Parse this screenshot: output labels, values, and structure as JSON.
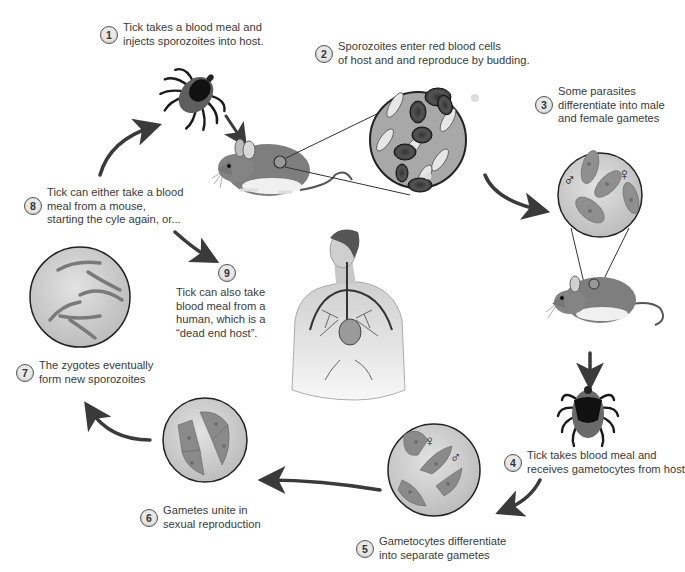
{
  "diagram": {
    "colors": {
      "line": "#3a3a3a",
      "circle_fill": "#cfcfcf",
      "cell_fill": "#8d8d8d",
      "tick_body": "#6b6b6b",
      "tick_shield": "#1a1a1a",
      "mouse_fur": "#7c7c7c",
      "belly": "#f0f0f0"
    }
  },
  "steps": [
    {
      "num": "1",
      "lines": [
        "Tick takes a blood meal and",
        "injects sporozoites into host."
      ]
    },
    {
      "num": "2",
      "lines": [
        "Sporozoites enter red blood cells",
        "of host and and reproduce by budding."
      ]
    },
    {
      "num": "3",
      "lines": [
        "Some parasites",
        "differentiate into male",
        "and female gametes"
      ]
    },
    {
      "num": "4",
      "lines": [
        "Tick takes blood meal and",
        "receives gametocytes from host"
      ]
    },
    {
      "num": "5",
      "lines": [
        "Gametocytes differentiate",
        "into separate gametes"
      ]
    },
    {
      "num": "6",
      "lines": [
        "Gametes unite in",
        "sexual reproduction"
      ]
    },
    {
      "num": "7",
      "lines": [
        "The zygotes eventually",
        "form new sporozoites"
      ]
    },
    {
      "num": "8",
      "lines": [
        "Tick can either take a blood",
        "meal from a mouse,",
        "starting the cyle again, or..."
      ]
    },
    {
      "num": "9",
      "lines": [
        "Tick can also take",
        "blood meal from a",
        "human, which is a",
        "“dead end host”."
      ]
    }
  ],
  "symbols": {
    "male": "♂",
    "female": "♀"
  },
  "illustrations": [
    "tick-feeding",
    "mouse-host",
    "blood-cells-magnified",
    "gametes-magnified",
    "mouse-host-2",
    "tick-engorged",
    "gametocytes-magnified",
    "zygotes-magnified",
    "sporozoites-magnified",
    "human-dead-end-host"
  ]
}
